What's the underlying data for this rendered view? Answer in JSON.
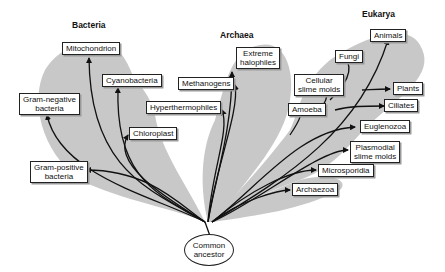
{
  "domains": {
    "bacteria": "Bacteria",
    "archaea": "Archaea",
    "eukarya": "Eukarya"
  },
  "root": {
    "line1": "Common",
    "line2": "ancestor"
  },
  "bacteria": [
    {
      "line1": "Mitochondrion"
    },
    {
      "line1": "Cyanobacteria"
    },
    {
      "line1": "Gram-negative",
      "line2": "bacteria"
    },
    {
      "line1": "Chloroplast"
    },
    {
      "line1": "Gram-positive",
      "line2": "bacteria"
    }
  ],
  "archaea": [
    {
      "line1": "Extreme",
      "line2": "halophiles"
    },
    {
      "line1": "Methanogens"
    },
    {
      "line1": "Hyperthermophiles"
    }
  ],
  "eukarya": [
    {
      "line1": "Animals"
    },
    {
      "line1": "Fungi"
    },
    {
      "line1": "Cellular",
      "line2": "slime molds"
    },
    {
      "line1": "Plants"
    },
    {
      "line1": "Amoeba"
    },
    {
      "line1": "Ciliates"
    },
    {
      "line1": "Euglenozoa"
    },
    {
      "line1": "Plasmodial",
      "line2": "slime molds"
    },
    {
      "line1": "Microsporidia"
    },
    {
      "line1": "Archaezoa"
    }
  ],
  "colors": {
    "shading": "#c8c8c8",
    "line": "#111111"
  }
}
